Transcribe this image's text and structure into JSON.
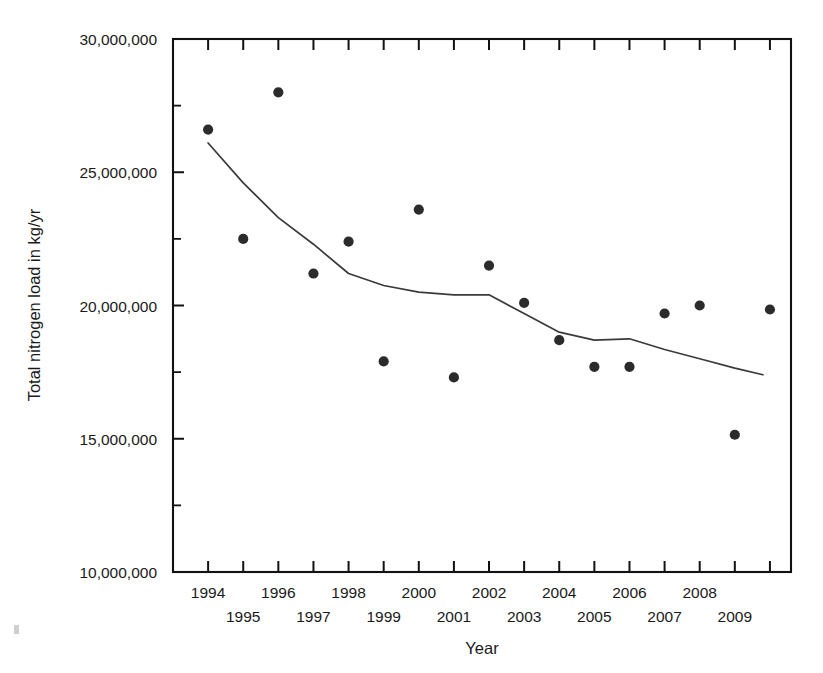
{
  "chart_data": {
    "type": "scatter",
    "title": "",
    "xlabel": "Year",
    "ylabel": "Total nitrogen load in kg/yr",
    "xlim": [
      1993.0,
      2010.6
    ],
    "ylim": [
      10000000,
      30000000
    ],
    "grid": false,
    "legend": "none",
    "y_tick_labels": [
      "30,000,000",
      "25,000,000",
      "20,000,000",
      "15,000,000",
      "10,000,000"
    ],
    "y_tick_values": [
      30000000,
      25000000,
      20000000,
      15000000,
      10000000
    ],
    "y_minor_tick_values": [
      27500000,
      22500000,
      17500000,
      12500000
    ],
    "x_tick_labels_top": [
      "1994",
      "1996",
      "1998",
      "2000",
      "2002",
      "2004",
      "2006",
      "2008"
    ],
    "x_tick_labels_bottom": [
      "1995",
      "1997",
      "1999",
      "2001",
      "2003",
      "2005",
      "2007",
      "2009"
    ],
    "x": [
      1994,
      1995,
      1996,
      1997,
      1998,
      1999,
      2000,
      2001,
      2002,
      2003,
      2004,
      2005,
      2006,
      2007,
      2008,
      2009,
      2010
    ],
    "values": [
      26600000,
      22500000,
      28000000,
      21200000,
      22400000,
      17900000,
      23600000,
      17300000,
      21500000,
      20100000,
      18700000,
      17700000,
      17700000,
      19700000,
      20000000,
      15150000,
      19850000
    ],
    "series": [
      {
        "name": "Annual total nitrogen load",
        "marker": "filled-circle",
        "color": "#2b2b2b",
        "x": [
          1994,
          1995,
          1996,
          1997,
          1998,
          1999,
          2000,
          2001,
          2002,
          2003,
          2004,
          2005,
          2006,
          2007,
          2008,
          2009,
          2010
        ],
        "values": [
          26600000,
          22500000,
          28000000,
          21200000,
          22400000,
          17900000,
          23600000,
          17300000,
          21500000,
          20100000,
          18700000,
          17700000,
          17700000,
          19700000,
          20000000,
          15150000,
          19850000
        ]
      },
      {
        "name": "Flow-adjusted trend line",
        "marker": "none",
        "color": "#3a3a3a",
        "x": [
          1994.0,
          1995.0,
          1996.0,
          1997.0,
          1998.0,
          1999.0,
          2000.0,
          2001.0,
          2002.0,
          2003.0,
          2004.0,
          2005.0,
          2006.0,
          2007.0,
          2008.0,
          2009.0,
          2009.8
        ],
        "values": [
          26100000,
          24600000,
          23300000,
          22300000,
          21200000,
          20750000,
          20500000,
          20400000,
          20400000,
          19700000,
          19000000,
          18700000,
          18750000,
          18350000,
          18000000,
          17650000,
          17400000
        ]
      }
    ]
  },
  "axis": {
    "x_title": "Year",
    "y_title": "Total nitrogen load in kg/yr"
  }
}
